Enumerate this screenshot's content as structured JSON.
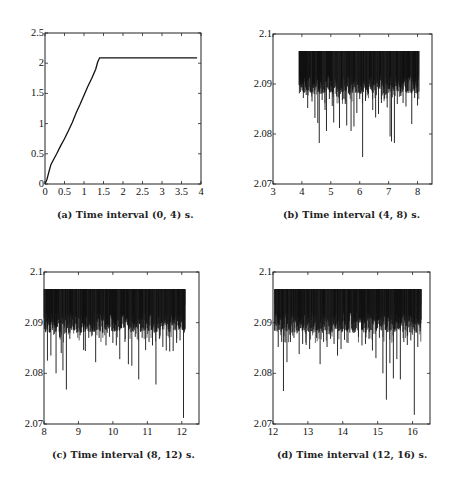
{
  "figure": {
    "captions": [
      "(a) Time interval (0, 4) s.",
      "(b) Time interval (4, 8) s.",
      "(c) Time interval (8, 12) s.",
      "(d) Time interval (12, 16) s."
    ]
  },
  "chart_data": [
    {
      "id": "a",
      "type": "line",
      "title": "(a) Time interval (0, 4) s.",
      "xlabel": "",
      "ylabel": "",
      "xlim": [
        0,
        4
      ],
      "ylim": [
        0,
        2.5
      ],
      "xticks": [
        0,
        0.5,
        1,
        1.5,
        2,
        2.5,
        3,
        3.5,
        4
      ],
      "xtick_labels": [
        "0",
        "0.5",
        "1",
        "1.5",
        "2",
        "2.5",
        "3",
        "3.5",
        "4"
      ],
      "yticks": [
        0,
        0.5,
        1,
        1.5,
        2,
        2.5
      ],
      "ytick_labels": [
        "0",
        "0.5",
        "1",
        "1.5",
        "2",
        "2.5"
      ],
      "grid": false,
      "x": [
        0,
        0.05,
        0.1,
        0.15,
        0.2,
        0.3,
        0.4,
        0.5,
        0.6,
        0.7,
        0.8,
        0.9,
        1.0,
        1.1,
        1.2,
        1.3,
        1.35,
        1.4,
        1.5,
        2.0,
        2.5,
        3.0,
        3.5,
        3.9
      ],
      "y": [
        0,
        0.08,
        0.2,
        0.32,
        0.38,
        0.5,
        0.63,
        0.75,
        0.88,
        1.02,
        1.18,
        1.32,
        1.47,
        1.62,
        1.75,
        1.9,
        2.02,
        2.09,
        2.09,
        2.09,
        2.09,
        2.09,
        2.09,
        2.09
      ]
    },
    {
      "id": "b",
      "type": "line",
      "title": "(b) Time interval (4, 8) s.",
      "xlabel": "",
      "ylabel": "",
      "xlim": [
        3,
        8.5
      ],
      "ylim": [
        2.07,
        2.1
      ],
      "xticks": [
        3,
        4,
        5,
        6,
        7,
        8
      ],
      "xtick_labels": [
        "3",
        "4",
        "5",
        "6",
        "7",
        "8"
      ],
      "yticks": [
        2.07,
        2.08,
        2.09,
        2.1
      ],
      "ytick_labels": [
        "2.07",
        "2.08",
        "2.09",
        "2.1"
      ],
      "grid": false,
      "data_range": [
        3.9,
        8.05
      ],
      "upper_envelope": 2.0966,
      "band_low": 2.092,
      "spikes": [
        [
          3.95,
          2.09
        ],
        [
          4.05,
          2.0872
        ],
        [
          4.15,
          2.0878
        ],
        [
          4.2,
          2.0852
        ],
        [
          4.35,
          2.0865
        ],
        [
          4.45,
          2.0832
        ],
        [
          4.55,
          2.0822
        ],
        [
          4.6,
          2.0782
        ],
        [
          4.7,
          2.0868
        ],
        [
          4.8,
          2.0848
        ],
        [
          4.85,
          2.0806
        ],
        [
          4.95,
          2.087
        ],
        [
          5.05,
          2.0856
        ],
        [
          5.1,
          2.0823
        ],
        [
          5.2,
          2.0875
        ],
        [
          5.3,
          2.0812
        ],
        [
          5.4,
          2.0868
        ],
        [
          5.5,
          2.086
        ],
        [
          5.55,
          2.0817
        ],
        [
          5.65,
          2.0878
        ],
        [
          5.7,
          2.0806
        ],
        [
          5.8,
          2.0815
        ],
        [
          5.9,
          2.0842
        ],
        [
          6.0,
          2.087
        ],
        [
          6.1,
          2.0754
        ],
        [
          6.2,
          2.0866
        ],
        [
          6.3,
          2.088
        ],
        [
          6.45,
          2.0848
        ],
        [
          6.55,
          2.0833
        ],
        [
          6.65,
          2.084
        ],
        [
          6.75,
          2.0862
        ],
        [
          6.85,
          2.087
        ],
        [
          6.95,
          2.0853
        ],
        [
          7.05,
          2.0795
        ],
        [
          7.1,
          2.0785
        ],
        [
          7.2,
          2.0782
        ],
        [
          7.3,
          2.086
        ],
        [
          7.4,
          2.0876
        ],
        [
          7.5,
          2.0862
        ],
        [
          7.6,
          2.0855
        ],
        [
          7.7,
          2.0882
        ],
        [
          7.8,
          2.082
        ],
        [
          7.9,
          2.0872
        ],
        [
          8.0,
          2.0857
        ]
      ]
    },
    {
      "id": "c",
      "type": "line",
      "title": "(c) Time interval (8, 12) s.",
      "xlabel": "",
      "ylabel": "",
      "xlim": [
        8,
        12.5
      ],
      "ylim": [
        2.07,
        2.1
      ],
      "xticks": [
        8,
        9,
        10,
        11,
        12
      ],
      "xtick_labels": [
        "8",
        "9",
        "10",
        "11",
        "12"
      ],
      "yticks": [
        2.07,
        2.08,
        2.09,
        2.1
      ],
      "ytick_labels": [
        "2.07",
        "2.08",
        "2.09",
        "2.1"
      ],
      "grid": false,
      "data_range": [
        8.0,
        12.1
      ],
      "upper_envelope": 2.0966,
      "band_low": 2.092,
      "spikes": [
        [
          8.05,
          2.0882
        ],
        [
          8.1,
          2.0825
        ],
        [
          8.2,
          2.0835
        ],
        [
          8.3,
          2.0878
        ],
        [
          8.35,
          2.08
        ],
        [
          8.45,
          2.0872
        ],
        [
          8.5,
          2.084
        ],
        [
          8.55,
          2.0806
        ],
        [
          8.65,
          2.0768
        ],
        [
          8.75,
          2.0868
        ],
        [
          8.85,
          2.0885
        ],
        [
          8.95,
          2.088
        ],
        [
          9.05,
          2.0875
        ],
        [
          9.15,
          2.0846
        ],
        [
          9.2,
          2.0844
        ],
        [
          9.3,
          2.087
        ],
        [
          9.4,
          2.0875
        ],
        [
          9.5,
          2.0822
        ],
        [
          9.6,
          2.087
        ],
        [
          9.7,
          2.088
        ],
        [
          9.8,
          2.0855
        ],
        [
          9.9,
          2.0872
        ],
        [
          10.0,
          2.086
        ],
        [
          10.1,
          2.0855
        ],
        [
          10.2,
          2.0828
        ],
        [
          10.35,
          2.0862
        ],
        [
          10.45,
          2.0818
        ],
        [
          10.55,
          2.0815
        ],
        [
          10.65,
          2.0872
        ],
        [
          10.75,
          2.0788
        ],
        [
          10.85,
          2.087
        ],
        [
          10.95,
          2.0846
        ],
        [
          11.05,
          2.0862
        ],
        [
          11.15,
          2.0855
        ],
        [
          11.25,
          2.0778
        ],
        [
          11.35,
          2.0868
        ],
        [
          11.45,
          2.0852
        ],
        [
          11.55,
          2.0845
        ],
        [
          11.65,
          2.0843
        ],
        [
          11.75,
          2.0844
        ],
        [
          11.85,
          2.086
        ],
        [
          11.95,
          2.0865
        ],
        [
          12.05,
          2.0712
        ]
      ]
    },
    {
      "id": "d",
      "type": "line",
      "title": "(d) Time interval (12, 16) s.",
      "xlabel": "",
      "ylabel": "",
      "xlim": [
        12,
        16.5
      ],
      "ylim": [
        2.07,
        2.1
      ],
      "xticks": [
        12,
        13,
        14,
        15,
        16
      ],
      "xtick_labels": [
        "12",
        "13",
        "14",
        "15",
        "16"
      ],
      "yticks": [
        2.07,
        2.08,
        2.09,
        2.1
      ],
      "ytick_labels": [
        "2.07",
        "2.08",
        "2.09",
        "2.1"
      ],
      "grid": false,
      "data_range": [
        12.05,
        16.25
      ],
      "upper_envelope": 2.0966,
      "band_low": 2.092,
      "spikes": [
        [
          12.05,
          2.0885
        ],
        [
          12.15,
          2.0852
        ],
        [
          12.25,
          2.0862
        ],
        [
          12.3,
          2.0765
        ],
        [
          12.4,
          2.0822
        ],
        [
          12.5,
          2.0862
        ],
        [
          12.6,
          2.087
        ],
        [
          12.75,
          2.0838
        ],
        [
          12.85,
          2.0858
        ],
        [
          12.95,
          2.0856
        ],
        [
          13.05,
          2.0848
        ],
        [
          13.15,
          2.088
        ],
        [
          13.25,
          2.087
        ],
        [
          13.35,
          2.0818
        ],
        [
          13.45,
          2.0862
        ],
        [
          13.55,
          2.0852
        ],
        [
          13.65,
          2.0868
        ],
        [
          13.75,
          2.0858
        ],
        [
          13.85,
          2.0835
        ],
        [
          13.95,
          2.0848
        ],
        [
          14.05,
          2.0866
        ],
        [
          14.15,
          2.086
        ],
        [
          14.3,
          2.088
        ],
        [
          14.45,
          2.0872
        ],
        [
          14.55,
          2.0855
        ],
        [
          14.65,
          2.0858
        ],
        [
          14.75,
          2.0868
        ],
        [
          14.85,
          2.0845
        ],
        [
          14.95,
          2.083
        ],
        [
          15.05,
          2.087
        ],
        [
          15.15,
          2.08
        ],
        [
          15.25,
          2.0748
        ],
        [
          15.35,
          2.082
        ],
        [
          15.45,
          2.079
        ],
        [
          15.55,
          2.0828
        ],
        [
          15.65,
          2.0788
        ],
        [
          15.75,
          2.0862
        ],
        [
          15.85,
          2.0856
        ],
        [
          15.95,
          2.0865
        ],
        [
          16.05,
          2.0718
        ],
        [
          16.15,
          2.0852
        ],
        [
          16.22,
          2.089
        ]
      ]
    }
  ]
}
